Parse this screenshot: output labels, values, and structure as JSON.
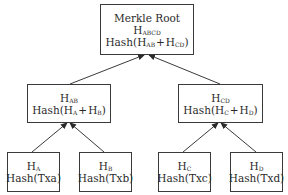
{
  "diagram": {
    "type": "merkle-tree",
    "root": {
      "title": "Merkle Root",
      "hash_label": "H",
      "hash_sub": "ABCD",
      "formula": {
        "prefix": "Hash(",
        "a": "H",
        "a_sub": "AB",
        "op": "+",
        "b": "H",
        "b_sub": "CD",
        "suffix": ")"
      }
    },
    "level1": [
      {
        "hash_label": "H",
        "hash_sub": "AB",
        "formula": {
          "prefix": "Hash(",
          "a": "H",
          "a_sub": "A",
          "op": "+",
          "b": "H",
          "b_sub": "B",
          "suffix": ")"
        }
      },
      {
        "hash_label": "H",
        "hash_sub": "CD",
        "formula": {
          "prefix": "Hash(",
          "a": "H",
          "a_sub": "C",
          "op": "+",
          "b": "H",
          "b_sub": "D",
          "suffix": ")"
        }
      }
    ],
    "leaves": [
      {
        "hash_label": "H",
        "hash_sub": "A",
        "formula": "Hash(Txa)"
      },
      {
        "hash_label": "H",
        "hash_sub": "B",
        "formula": "Hash(Txb)"
      },
      {
        "hash_label": "H",
        "hash_sub": "C",
        "formula": "Hash(Txc)"
      },
      {
        "hash_label": "H",
        "hash_sub": "D",
        "formula": "Hash(Txd)"
      }
    ],
    "edges": [
      {
        "from": "leaf-A",
        "to": "H_AB"
      },
      {
        "from": "leaf-B",
        "to": "H_AB"
      },
      {
        "from": "leaf-C",
        "to": "H_CD"
      },
      {
        "from": "leaf-D",
        "to": "H_CD"
      },
      {
        "from": "H_AB",
        "to": "root"
      },
      {
        "from": "H_CD",
        "to": "root"
      }
    ],
    "colors": {
      "stroke": "#3a3a3a",
      "text": "#2a2a2a",
      "background": "#ffffff"
    }
  }
}
